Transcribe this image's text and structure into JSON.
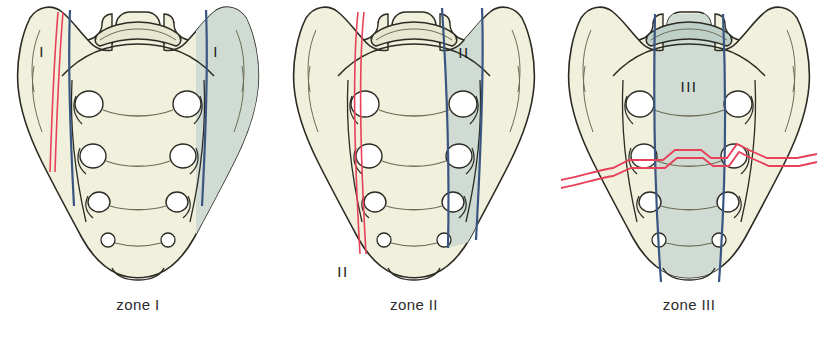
{
  "figure": {
    "panel_count": 3,
    "background_color": "#ffffff"
  },
  "colors": {
    "bone_fill": "#f0f0dc",
    "zone_shade": "#cfdbd3",
    "zone_shade_dark": "#bfd0c9",
    "outline": "#2b2b24",
    "inner_line": "#6d6d55",
    "fracture_red": "#e8415a",
    "zone_line_blue": "#3a5580",
    "label_text": "#1a1a1a",
    "caption_text": "#2c2c2c"
  },
  "panels": [
    {
      "id": "panel-1",
      "caption": "zone I",
      "zone_numeral": "I",
      "shaded_region": "sacral ala (wing), bilateral",
      "fracture_description": "vertical fracture line through the left sacral ala, lateral to the foramina",
      "labels": [
        {
          "text": "I",
          "side": "left"
        },
        {
          "text": "I",
          "side": "right"
        }
      ]
    },
    {
      "id": "panel-2",
      "caption": "zone II",
      "zone_numeral": "II",
      "shaded_region": "sacral foraminal region",
      "fracture_description": "vertical fracture line running through the left sacral foramina",
      "labels": [
        {
          "text": "II",
          "side": "right-band"
        },
        {
          "text": "II",
          "side": "bottom-left"
        }
      ]
    },
    {
      "id": "panel-3",
      "caption": "zone III",
      "zone_numeral": "III",
      "shaded_region": "central sacral canal region, medial to the foramina",
      "fracture_description": "transverse fracture line crossing the central sacral canal",
      "labels": [
        {
          "text": "III",
          "side": "center-band"
        }
      ]
    }
  ],
  "anatomy": {
    "structure": "sacrum, posterior (dorsal) view",
    "foramina_pairs": 4,
    "features": [
      "sacral canal opening",
      "superior articular processes",
      "sacral ala",
      "anterior sacral foramina",
      "transverse ridges",
      "sacral apex"
    ]
  }
}
